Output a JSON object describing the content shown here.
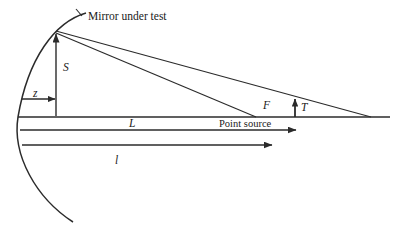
{
  "figure": {
    "type": "optical-ray-diagram",
    "background_color": "#ffffff",
    "stroke_color": "#2b2b2b",
    "labels": {
      "mirror_under_test": "Mirror under test",
      "point_source": "Point source",
      "sagitta_S": "S",
      "depth_z": "z",
      "distance_L": "L",
      "distance_l": "l",
      "focus_F": "F",
      "offset_T": "T"
    },
    "icons": {
      "mirror_curve": "parabolic-mirror-curve",
      "optical_axis": "horizontal-axis-line",
      "ray_upper": "ray-line-upper",
      "ray_lower": "ray-line-lower",
      "arrow_s": "up-arrow",
      "arrow_z": "right-arrow",
      "arrow_l_upper": "right-arrow",
      "arrow_l_lower": "right-arrow",
      "arrow_t": "up-arrow"
    }
  }
}
